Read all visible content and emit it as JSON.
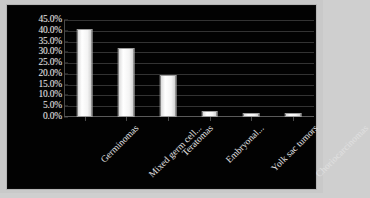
{
  "chart_data": {
    "type": "bar",
    "title": "",
    "subtitle": "",
    "xlabel": "",
    "ylabel": "",
    "categories": [
      "Germinomas",
      "Mixed germ cell...",
      "Teratomas",
      "Embryonal...",
      "Yolk sac tumors",
      "Choriocarcinomas"
    ],
    "values": [
      41.0,
      32.0,
      19.5,
      3.0,
      2.0,
      2.0
    ],
    "ylim": [
      0,
      45
    ],
    "ytick_values": [
      0,
      5,
      10,
      15,
      20,
      25,
      30,
      35,
      40,
      45
    ],
    "ytick_labels": [
      "0.0%",
      "5.0%",
      "10.0%",
      "15.0%",
      "20.0%",
      "25.0%",
      "30.0%",
      "35.0%",
      "40.0%",
      "45.0%"
    ],
    "grid": true,
    "legend": false,
    "legend_position": "none",
    "bar_color": "#f2f2f2",
    "background_color": "#020202",
    "grid_color": "#333333",
    "text_color": "#e2e2e2",
    "frame_color": "#c9c9c9"
  }
}
